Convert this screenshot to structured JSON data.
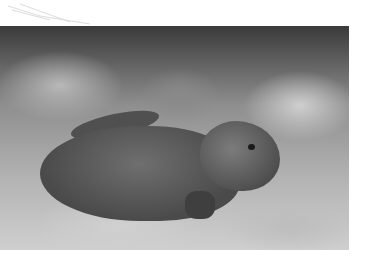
{
  "image": {
    "subject": "bearded dragon lizard resting on wood-shaving substrate",
    "style": "grayscale photograph",
    "alt": "Bearded dragon on substrate"
  }
}
